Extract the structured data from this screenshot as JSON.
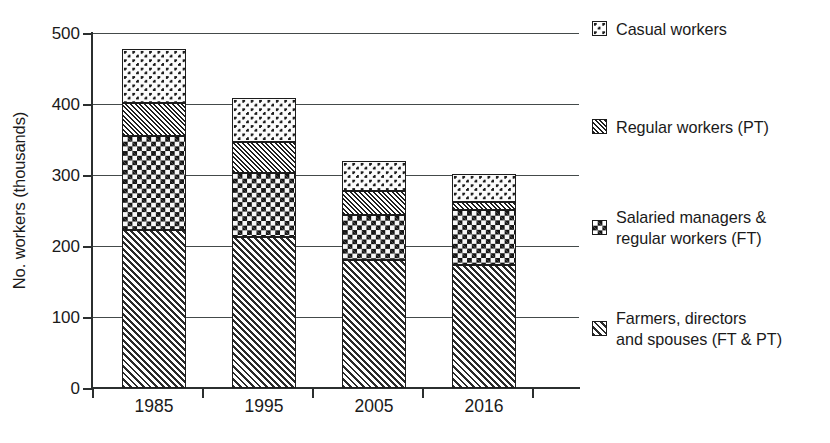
{
  "chart_data": {
    "type": "bar",
    "stacked": true,
    "title": "",
    "subtitle": "",
    "xlabel": "",
    "ylabel": "No. workers (thousands)",
    "categories": [
      "1985",
      "1995",
      "2005",
      "2016"
    ],
    "ylim": [
      0,
      500
    ],
    "yticks": [
      0,
      100,
      200,
      300,
      400,
      500
    ],
    "ytick_labels": [
      "0",
      "100",
      "200",
      "300",
      "400",
      "500"
    ],
    "grid": true,
    "legend_position": "right",
    "series": [
      {
        "name": "Farmers, directors and spouses (FT & PT)",
        "pattern": "coarse-diagonal-hatch",
        "values": [
          222,
          213,
          181,
          173
        ]
      },
      {
        "name": "Salaried managers & regular workers (FT)",
        "pattern": "dense-checkerboard",
        "values": [
          133,
          90,
          63,
          78
        ]
      },
      {
        "name": "Regular workers (PT)",
        "pattern": "fine-diagonal-hatch",
        "values": [
          46,
          44,
          34,
          11
        ]
      },
      {
        "name": "Casual workers",
        "pattern": "light-dotted",
        "values": [
          76,
          62,
          42,
          40
        ]
      }
    ],
    "totals": [
      477,
      409,
      320,
      302
    ],
    "colors": {
      "ink": "#1c1c1c",
      "gridline": "#444a4a",
      "background": "#ffffff"
    }
  },
  "axes": {
    "y_title": "No. workers (thousands)",
    "y_tick_labels": [
      "500",
      "400",
      "300",
      "200",
      "100",
      "0"
    ],
    "x_tick_labels": [
      "1985",
      "1995",
      "2005",
      "2016"
    ]
  },
  "legend": {
    "items": [
      {
        "label": "Casual workers",
        "pattern": "light-dotted"
      },
      {
        "label": "Regular workers (PT)",
        "pattern": "fine-diagonal-hatch"
      },
      {
        "label": "Salaried managers &\nregular workers (FT)",
        "pattern": "dense-checkerboard"
      },
      {
        "label": "Farmers, directors\nand spouses (FT & PT)",
        "pattern": "coarse-diagonal-hatch"
      }
    ]
  }
}
